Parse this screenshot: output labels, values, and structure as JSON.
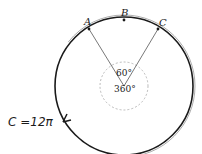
{
  "diagram": {
    "points": [
      {
        "label": "A",
        "x": 89,
        "y": 29,
        "lx": 84,
        "ly": 23
      },
      {
        "label": "B",
        "x": 124,
        "y": 20,
        "lx": 122,
        "ly": 14
      },
      {
        "label": "C",
        "x": 158,
        "y": 29,
        "lx": 159,
        "ly": 24
      }
    ],
    "center": {
      "x": 124,
      "y": 86
    },
    "radius": 69,
    "inner_radius": 24,
    "angle_small": "60°",
    "angle_full": "360°",
    "circumference_label": "C =12π",
    "colors": {
      "stroke": "#1a1a1a",
      "thin": "#555555",
      "dashed": "#aaaaaa"
    }
  }
}
